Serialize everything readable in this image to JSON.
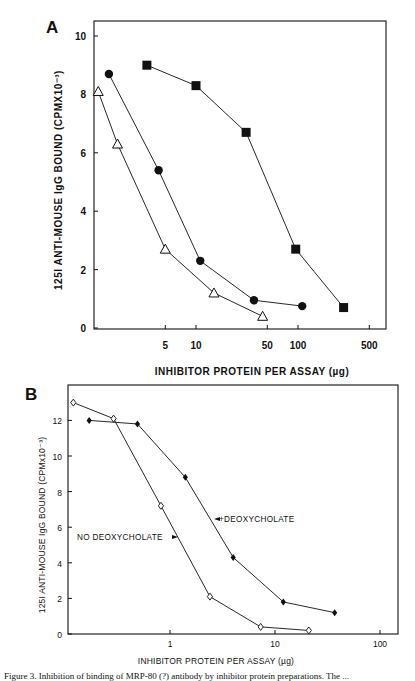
{
  "panels": {
    "a": {
      "letter": "A"
    },
    "b": {
      "letter": "B"
    }
  },
  "caption": "Figure 3. Inhibition of binding of MRP-80 (?) antibody by inhibitor protein preparations. The ...",
  "chart_data": [
    {
      "id": "A",
      "type": "line",
      "title": "",
      "xlabel": "INHIBITOR  PROTEIN  PER  ASSAY  (µg)",
      "ylabel": "125I  ANTI-MOUSE  IgG  BOUND  (CPMX10⁻³)",
      "xscale": "log",
      "xlim": [
        1,
        700
      ],
      "ylim": [
        0,
        10.5
      ],
      "xticks": [
        5,
        10,
        50,
        100,
        500
      ],
      "xtick_labels": [
        "5",
        "10",
        "50",
        "100",
        "500"
      ],
      "yticks": [
        0,
        2,
        4,
        6,
        8,
        10
      ],
      "ytick_labels": [
        "0",
        "2",
        "4",
        "6",
        "8",
        "10"
      ],
      "grid": false,
      "series": [
        {
          "name": "open triangles",
          "marker": "triangle-open",
          "x": [
            1.1,
            1.7,
            5.0,
            15,
            45
          ],
          "y": [
            8.1,
            6.3,
            2.7,
            1.2,
            0.4
          ]
        },
        {
          "name": "filled circles",
          "marker": "circle-filled",
          "x": [
            1.4,
            4.3,
            11,
            37,
            110
          ],
          "y": [
            8.7,
            5.4,
            2.3,
            0.95,
            0.75
          ]
        },
        {
          "name": "filled squares",
          "marker": "square-filled",
          "x": [
            3.3,
            10,
            31,
            95,
            280
          ],
          "y": [
            9.0,
            8.3,
            6.7,
            2.7,
            0.7
          ]
        }
      ]
    },
    {
      "id": "B",
      "type": "line",
      "title": "",
      "xlabel": "INHIBITOR PROTEIN PER ASSAY (µg)",
      "ylabel": "125I ANTI-MOUSE IgG BOUND (CPMx10⁻³)",
      "xscale": "log",
      "xlim": [
        0.1,
        160
      ],
      "ylim": [
        0,
        14
      ],
      "xticks": [
        1,
        10,
        100
      ],
      "xtick_labels": [
        "1",
        "10",
        "100"
      ],
      "yticks": [
        0,
        2,
        4,
        6,
        8,
        10,
        12
      ],
      "ytick_labels": [
        "0",
        "2",
        "4",
        "6",
        "8",
        "10",
        "12"
      ],
      "grid": false,
      "annotations": [
        {
          "text": "NO DEOXYCHOLATE",
          "arrow": "right"
        },
        {
          "text": "+DEOXYCHOLATE",
          "arrow": "left"
        }
      ],
      "series": [
        {
          "name": "NO DEOXYCHOLATE",
          "marker": "diamond-open",
          "x": [
            0.12,
            0.29,
            0.82,
            2.4,
            7.3,
            21
          ],
          "y": [
            13.0,
            12.1,
            7.2,
            2.1,
            0.4,
            0.2
          ]
        },
        {
          "name": "+DEOXYCHOLATE",
          "marker": "diamond-filled",
          "x": [
            0.17,
            0.49,
            1.4,
            4.0,
            12,
            37
          ],
          "y": [
            12.0,
            11.8,
            8.8,
            4.3,
            1.8,
            1.2
          ]
        }
      ]
    }
  ]
}
